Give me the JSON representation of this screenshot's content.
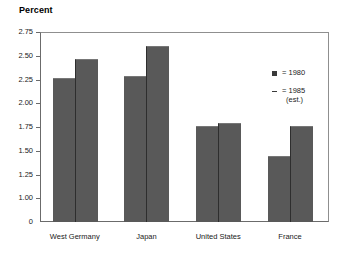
{
  "chart_data": {
    "type": "bar",
    "title": "Percent",
    "subtitle": "",
    "xlabel": "",
    "ylabel": "Percent",
    "categories": [
      "West Germany",
      "Japan",
      "United States",
      "France"
    ],
    "series": [
      {
        "name": "1980",
        "marker": "dot-marker",
        "values": [
          2.27,
          2.29,
          1.76,
          1.44
        ]
      },
      {
        "name": "1985 (est.)",
        "marker": "dash-marker",
        "values": [
          2.47,
          2.6,
          1.79,
          1.76
        ]
      }
    ],
    "yticks": [
      "2.75",
      "2.50",
      "2.25",
      "2.00",
      "1.75",
      "1.50",
      "1.25",
      "1.00",
      "0"
    ],
    "ytick_values": [
      2.75,
      2.5,
      2.25,
      2.0,
      1.75,
      1.5,
      1.25,
      1.0,
      0
    ],
    "ylim": [
      0.75,
      2.75
    ],
    "axis_break": true,
    "grid": false,
    "legend_position": "right-inside",
    "legend": [
      {
        "label": "= 1980",
        "sub": ""
      },
      {
        "label": "= 1985",
        "sub": "(est.)"
      }
    ],
    "bar_color": "#595959",
    "frame_color": "#8f8f8f",
    "background": "#ffffff"
  }
}
